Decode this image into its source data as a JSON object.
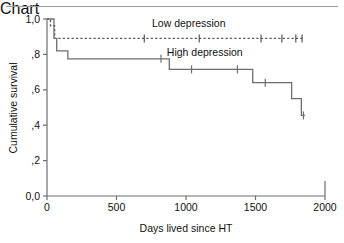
{
  "figure": {
    "has_top_rule": true,
    "background": "#ffffff",
    "axis_color": "#6e6e6e",
    "text_color": "#111111"
  },
  "chart_data": {
    "type": "line",
    "title": "",
    "subtitle": "",
    "xlabel": "Days lived since HT",
    "ylabel": "Cumulative survival",
    "xlim": [
      0,
      2000
    ],
    "ylim": [
      0.0,
      1.0
    ],
    "xticks": [
      0,
      500,
      1000,
      1500,
      2000
    ],
    "xtick_labels": [
      "0",
      "500",
      "1000",
      "1500",
      "2000"
    ],
    "yticks": [
      0.0,
      0.2,
      0.4,
      0.6,
      0.8,
      1.0
    ],
    "ytick_labels": [
      "0,0",
      ",2",
      ",4",
      ",6",
      ",8",
      "1,0"
    ],
    "grid": false,
    "legend_position": "inline-annotations",
    "decimal_separator": ",",
    "series": [
      {
        "name": "Low depression",
        "style": "dashed",
        "color": "#555555",
        "label_text": "Low depression",
        "label_x": 1020,
        "label_y": 0.955,
        "steps": [
          {
            "x": 0,
            "y": 1.0
          },
          {
            "x": 25,
            "y": 0.962
          },
          {
            "x": 55,
            "y": 0.89
          },
          {
            "x": 1850,
            "y": 0.89
          }
        ],
        "censor_marks": [
          {
            "x": 700,
            "y": 0.89
          },
          {
            "x": 1095,
            "y": 0.89
          },
          {
            "x": 1540,
            "y": 0.89
          },
          {
            "x": 1690,
            "y": 0.89
          },
          {
            "x": 1790,
            "y": 0.89
          },
          {
            "x": 1835,
            "y": 0.89
          }
        ]
      },
      {
        "name": "High depression",
        "style": "solid",
        "color": "#6e6e6e",
        "label_text": "High depression",
        "label_x": 1135,
        "label_y": 0.793,
        "steps": [
          {
            "x": 0,
            "y": 1.0
          },
          {
            "x": 50,
            "y": 0.89
          },
          {
            "x": 70,
            "y": 0.82
          },
          {
            "x": 150,
            "y": 0.775
          },
          {
            "x": 880,
            "y": 0.715
          },
          {
            "x": 1480,
            "y": 0.64
          },
          {
            "x": 1760,
            "y": 0.55
          },
          {
            "x": 1830,
            "y": 0.455
          },
          {
            "x": 1855,
            "y": 0.455
          }
        ],
        "censor_marks": [
          {
            "x": 820,
            "y": 0.775
          },
          {
            "x": 1040,
            "y": 0.715
          },
          {
            "x": 1370,
            "y": 0.715
          },
          {
            "x": 1570,
            "y": 0.64
          },
          {
            "x": 1845,
            "y": 0.455
          }
        ]
      }
    ]
  }
}
